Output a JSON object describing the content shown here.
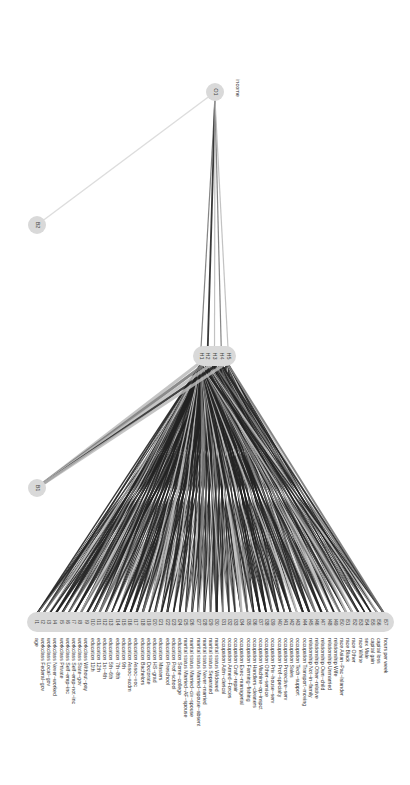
{
  "diagram": {
    "type": "neural-network",
    "orientation": "rotated-90-clockwise",
    "colors": {
      "background": "#ffffff",
      "node_fill": "#d9d9d9",
      "edge_dark": "#222222",
      "edge_mid": "#777777",
      "edge_light": "#bbbbbb",
      "label": "#333333"
    },
    "output_label": "income",
    "output_nodes": [
      {
        "id": "O1"
      }
    ],
    "bias_nodes": [
      {
        "id": "B1"
      },
      {
        "id": "B2"
      }
    ],
    "hidden_nodes": [
      {
        "id": "H1"
      },
      {
        "id": "H2"
      },
      {
        "id": "H3"
      },
      {
        "id": "H4"
      },
      {
        "id": "H5"
      }
    ],
    "input_nodes": [
      {
        "id": "I1",
        "label": "age"
      },
      {
        "id": "I2",
        "label": "workclass Federal−gov"
      },
      {
        "id": "I3",
        "label": "workclass Local−gov"
      },
      {
        "id": "I4",
        "label": "workclass Never−worked"
      },
      {
        "id": "I5",
        "label": "workclass Private"
      },
      {
        "id": "I6",
        "label": "workclass Self−emp−inc"
      },
      {
        "id": "I7",
        "label": "workclass Self−emp−not−inc"
      },
      {
        "id": "I8",
        "label": "workclass State−gov"
      },
      {
        "id": "I9",
        "label": "workclass Without−pay"
      },
      {
        "id": "I10",
        "label": "education 11th"
      },
      {
        "id": "I11",
        "label": "education 12th"
      },
      {
        "id": "I12",
        "label": "education 1st−4th"
      },
      {
        "id": "I13",
        "label": "education 5th−6th"
      },
      {
        "id": "I14",
        "label": "education 7th−8th"
      },
      {
        "id": "I15",
        "label": "education 9th"
      },
      {
        "id": "I16",
        "label": "education Assoc−acdm"
      },
      {
        "id": "I17",
        "label": "education Assoc−voc"
      },
      {
        "id": "I18",
        "label": "education Bachelors"
      },
      {
        "id": "I19",
        "label": "education Doctorate"
      },
      {
        "id": "I20",
        "label": "education HS−grad"
      },
      {
        "id": "I21",
        "label": "education Masters"
      },
      {
        "id": "I22",
        "label": "education Preschool"
      },
      {
        "id": "I23",
        "label": "education Prof−school"
      },
      {
        "id": "I24",
        "label": "education Some−college"
      },
      {
        "id": "I25",
        "label": "marital status Married−AF−spouse"
      },
      {
        "id": "I26",
        "label": "marital status Married−civ−spouse"
      },
      {
        "id": "I27",
        "label": "marital status Married−spouse−absent"
      },
      {
        "id": "I28",
        "label": "marital status Never−married"
      },
      {
        "id": "I29",
        "label": "marital status Separated"
      },
      {
        "id": "I30",
        "label": "marital status Widowed"
      },
      {
        "id": "I31",
        "label": "occupation Adm−clerical"
      },
      {
        "id": "I32",
        "label": "occupation Armed−Forces"
      },
      {
        "id": "I33",
        "label": "occupation Craft−repair"
      },
      {
        "id": "I34",
        "label": "occupation Exec−managerial"
      },
      {
        "id": "I35",
        "label": "occupation Farming−fishing"
      },
      {
        "id": "I36",
        "label": "occupation Handlers−cleaners"
      },
      {
        "id": "I37",
        "label": "occupation Machine−op−inspct"
      },
      {
        "id": "I38",
        "label": "occupation Other−service"
      },
      {
        "id": "I39",
        "label": "occupation Priv−house−serv"
      },
      {
        "id": "I40",
        "label": "occupation Prof−specialty"
      },
      {
        "id": "I41",
        "label": "occupation Protective−serv"
      },
      {
        "id": "I42",
        "label": "occupation Sales"
      },
      {
        "id": "I43",
        "label": "occupation Tech−support"
      },
      {
        "id": "I44",
        "label": "occupation Transport−moving"
      },
      {
        "id": "I45",
        "label": "relationship Not−in−family"
      },
      {
        "id": "I46",
        "label": "relationship Other−relative"
      },
      {
        "id": "I47",
        "label": "relationship Own−child"
      },
      {
        "id": "I48",
        "label": "relationship Unmarried"
      },
      {
        "id": "I49",
        "label": "relationship Wife"
      },
      {
        "id": "I50",
        "label": "race Asian−Pac−Islander"
      },
      {
        "id": "I51",
        "label": "race Black"
      },
      {
        "id": "I52",
        "label": "race Other"
      },
      {
        "id": "I53",
        "label": "race White"
      },
      {
        "id": "I54",
        "label": "sex Male"
      },
      {
        "id": "I55",
        "label": "capital gain"
      },
      {
        "id": "I56",
        "label": "capital loss"
      },
      {
        "id": "I57",
        "label": "hours per week"
      }
    ]
  }
}
